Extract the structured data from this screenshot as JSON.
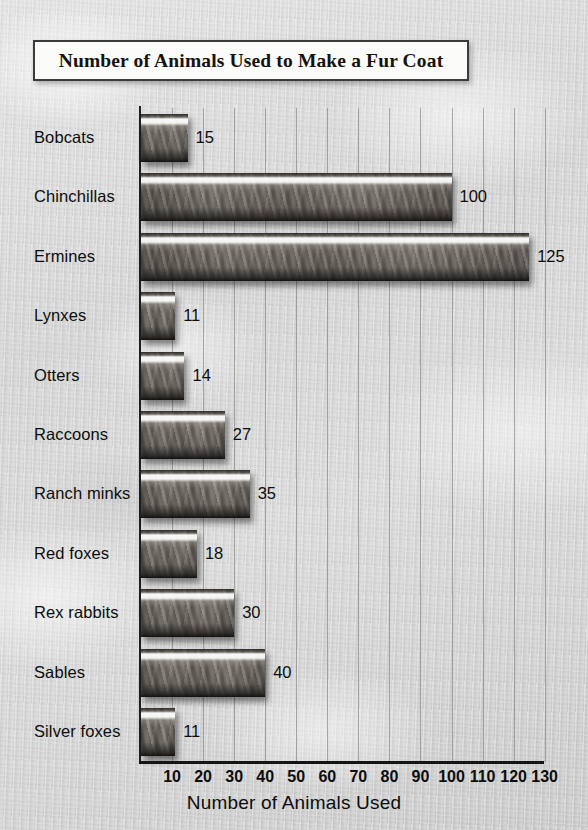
{
  "title": "Number of Animals Used to Make a Fur Coat",
  "chart_data": {
    "type": "bar",
    "orientation": "horizontal",
    "title": "Number of Animals Used to Make a Fur Coat",
    "xlabel": "Number of Animals Used",
    "ylabel": "",
    "categories": [
      "Bobcats",
      "Chinchillas",
      "Ermines",
      "Lynxes",
      "Otters",
      "Raccoons",
      "Ranch minks",
      "Red foxes",
      "Rex rabbits",
      "Sables",
      "Silver foxes"
    ],
    "values": [
      15,
      100,
      125,
      11,
      14,
      27,
      35,
      18,
      30,
      40,
      11
    ],
    "value_labels": [
      "15",
      "100",
      "125",
      "11",
      "14",
      "27",
      "35",
      "18",
      "30",
      "40",
      "11"
    ],
    "xlim": [
      0,
      130
    ],
    "xticks": [
      10,
      20,
      30,
      40,
      50,
      60,
      70,
      80,
      90,
      100,
      110,
      120,
      130
    ],
    "xtick_labels": [
      "10",
      "20",
      "30",
      "40",
      "50",
      "60",
      "70",
      "80",
      "90",
      "100",
      "110",
      "120",
      "130"
    ],
    "grid": true,
    "grid_axis": "x",
    "legend": false,
    "bar_style": "fur-texture",
    "colors": {
      "background": "#d4d4d4",
      "bar_fill": "#6d6862",
      "axis": "#141414",
      "gridline": "#8d8d8d",
      "text": "#0d0d0d",
      "title_box_fill": "#fbfbfa",
      "title_box_border": "#3b3b3b"
    }
  }
}
